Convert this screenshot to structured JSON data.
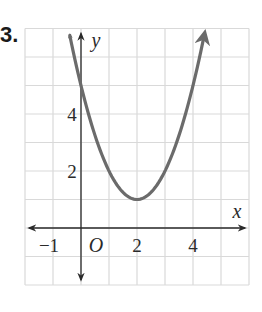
{
  "problem": {
    "number": "3."
  },
  "chart_data": {
    "type": "line",
    "title": "",
    "xlabel": "x",
    "ylabel": "y",
    "origin_label": "O",
    "xlim": [
      -2,
      6
    ],
    "ylim": [
      -2,
      7
    ],
    "grid": true,
    "x_tick_labels": [
      {
        "value": -1,
        "label": "−1"
      },
      {
        "value": 2,
        "label": "2"
      },
      {
        "value": 4,
        "label": "4"
      }
    ],
    "y_tick_labels": [
      {
        "value": 2,
        "label": "2"
      },
      {
        "value": 4,
        "label": "4"
      }
    ],
    "series": [
      {
        "name": "parabola",
        "equation": "y = (x - 2)^2 + 1",
        "vertex": [
          2,
          1
        ],
        "color": "#6b6b6b",
        "points": [
          {
            "x": -0.4,
            "y": 6.76
          },
          {
            "x": 0,
            "y": 5
          },
          {
            "x": 1,
            "y": 2
          },
          {
            "x": 2,
            "y": 1
          },
          {
            "x": 3,
            "y": 2
          },
          {
            "x": 4,
            "y": 5
          },
          {
            "x": 4.4,
            "y": 6.76
          }
        ]
      }
    ],
    "colors": {
      "grid": "#d9d9d9",
      "axis": "#2a2a2a",
      "curve": "#6b6b6b"
    }
  }
}
